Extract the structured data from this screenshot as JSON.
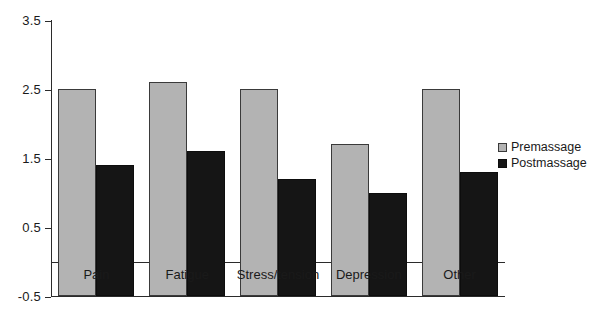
{
  "chart_data": {
    "type": "bar",
    "title": "",
    "xlabel": "",
    "ylabel": "",
    "ylim": [
      -0.5,
      3.5
    ],
    "ytick_labels": [
      "3.5",
      "2.5",
      "1.5",
      "0.5",
      "-0.5"
    ],
    "ytick_values": [
      3.5,
      2.5,
      1.5,
      0.5,
      -0.5
    ],
    "grid": false,
    "legend_position": "right",
    "categories": [
      "Pain",
      "Fatigue",
      "Stress/tension",
      "Depression",
      "Other"
    ],
    "series": [
      {
        "name": "Premassage",
        "color": "#b3b3b3",
        "values": [
          3.0,
          3.1,
          3.0,
          2.2,
          3.0
        ]
      },
      {
        "name": "Postmassage",
        "color": "#151515",
        "values": [
          1.9,
          2.1,
          1.7,
          1.5,
          1.8
        ]
      }
    ]
  },
  "legend": {
    "items": [
      {
        "label": "Premassage",
        "swatch": "legend-swatch-premassage"
      },
      {
        "label": "Postmassage",
        "swatch": "legend-swatch-postmassage"
      }
    ]
  }
}
